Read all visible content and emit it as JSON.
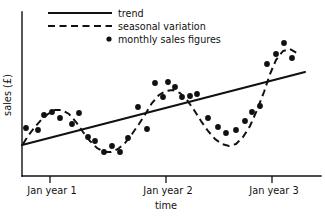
{
  "chart_data": {
    "type": "line",
    "title": "",
    "xlabel": "time",
    "ylabel": "sales (£)",
    "grid": false,
    "legend_position": "top-center",
    "axis": {
      "x_tick_labels": [
        "Jan year 1",
        "Jan year 2",
        "Jan year 3"
      ],
      "x_tick_positions": [
        50,
        166,
        272
      ],
      "y_tick_labels": [],
      "xlim": [
        0,
        36
      ],
      "ylim": [
        0,
        100
      ]
    },
    "legend": [
      {
        "label": "trend",
        "marker": "solid-line"
      },
      {
        "label": "seasonal variation",
        "marker": "dashed-line"
      },
      {
        "label": "monthly sales figures",
        "marker": "dot"
      }
    ],
    "series": [
      {
        "name": "trend",
        "style": "solid-line",
        "points_px": [
          [
            22,
            145
          ],
          [
            305,
            72
          ]
        ]
      },
      {
        "name": "seasonal variation",
        "style": "dashed-line",
        "points_px": [
          [
            23,
            144
          ],
          [
            28,
            136
          ],
          [
            34,
            128
          ],
          [
            41,
            120
          ],
          [
            48,
            114
          ],
          [
            55,
            110
          ],
          [
            62,
            110
          ],
          [
            69,
            114
          ],
          [
            76,
            122
          ],
          [
            83,
            132
          ],
          [
            90,
            141
          ],
          [
            97,
            148
          ],
          [
            104,
            152
          ],
          [
            111,
            152
          ],
          [
            118,
            149
          ],
          [
            125,
            143
          ],
          [
            132,
            134
          ],
          [
            139,
            124
          ],
          [
            146,
            113
          ],
          [
            152,
            103
          ],
          [
            159,
            95
          ],
          [
            166,
            91
          ],
          [
            173,
            90
          ],
          [
            180,
            93
          ],
          [
            187,
            100
          ],
          [
            194,
            110
          ],
          [
            201,
            121
          ],
          [
            208,
            131
          ],
          [
            215,
            139
          ],
          [
            222,
            144
          ],
          [
            229,
            146
          ],
          [
            236,
            144
          ],
          [
            243,
            137
          ],
          [
            250,
            126
          ],
          [
            257,
            110
          ],
          [
            264,
            92
          ],
          [
            270,
            74
          ],
          [
            276,
            60
          ],
          [
            283,
            51
          ],
          [
            290,
            49
          ],
          [
            297,
            53
          ]
        ]
      },
      {
        "name": "monthly sales figures",
        "style": "dot",
        "points_px": [
          [
            26,
            128
          ],
          [
            38,
            130
          ],
          [
            44,
            115
          ],
          [
            52,
            112
          ],
          [
            60,
            118
          ],
          [
            72,
            124
          ],
          [
            79,
            113
          ],
          [
            88,
            137
          ],
          [
            95,
            141
          ],
          [
            104,
            152
          ],
          [
            112,
            146
          ],
          [
            120,
            152
          ],
          [
            128,
            138
          ],
          [
            138,
            107
          ],
          [
            147,
            129
          ],
          [
            155,
            83
          ],
          [
            163,
            97
          ],
          [
            168,
            82
          ],
          [
            175,
            87
          ],
          [
            182,
            97
          ],
          [
            190,
            96
          ],
          [
            197,
            94
          ],
          [
            208,
            118
          ],
          [
            218,
            127
          ],
          [
            226,
            133
          ],
          [
            236,
            130
          ],
          [
            245,
            121
          ],
          [
            252,
            112
          ],
          [
            260,
            106
          ],
          [
            267,
            64
          ],
          [
            276,
            54
          ],
          [
            284,
            43
          ],
          [
            292,
            58
          ]
        ]
      }
    ]
  },
  "legend_geometry": {
    "rows": [
      {
        "sample_x1": 48,
        "sample_x2": 112,
        "y": 13,
        "text_x": 118
      },
      {
        "sample_x1": 48,
        "sample_x2": 112,
        "y": 26,
        "text_x": 118
      },
      {
        "sample_cx": 108,
        "y": 39,
        "text_x": 118
      }
    ]
  }
}
